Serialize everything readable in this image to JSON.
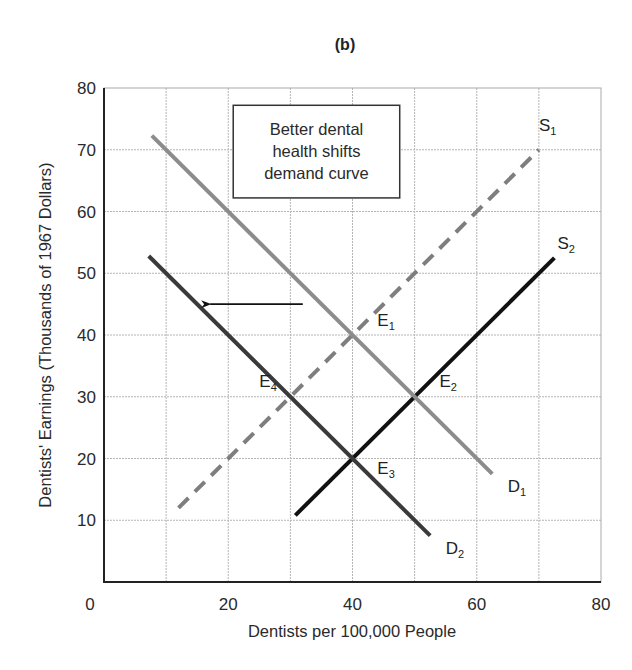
{
  "chart_data": {
    "type": "line",
    "title": "(b)",
    "xlabel": "Dentists per 100,000 People",
    "ylabel": "Dentists' Earnings (Thousands of 1967 Dollars)",
    "xlim": [
      0,
      80
    ],
    "ylim": [
      0,
      80
    ],
    "x_ticks": [
      0,
      20,
      40,
      60,
      80
    ],
    "y_ticks": [
      10,
      20,
      30,
      40,
      50,
      60,
      70,
      80
    ],
    "grid": true,
    "grid_step": 10,
    "legend": "none (curves labeled directly)",
    "series": [
      {
        "name": "S1",
        "label": "S",
        "sub": "1",
        "style": "dashed",
        "color": "#7e7e7e",
        "points": [
          [
            12,
            12
          ],
          [
            70,
            70
          ]
        ],
        "label_pos": [
          70,
          73
        ]
      },
      {
        "name": "S2",
        "label": "S",
        "sub": "2",
        "style": "solid",
        "color": "#111111",
        "points": [
          [
            30.8,
            10.8
          ],
          [
            72.5,
            52.5
          ]
        ],
        "label_pos": [
          73,
          54
        ]
      },
      {
        "name": "D1",
        "label": "D",
        "sub": "1",
        "style": "solid",
        "color": "#8c8c8c",
        "points": [
          [
            7.7,
            72.3
          ],
          [
            62.5,
            17.5
          ]
        ],
        "label_pos": [
          65,
          14.5
        ]
      },
      {
        "name": "D2",
        "label": "D",
        "sub": "2",
        "style": "solid",
        "color": "#3a3a3a",
        "points": [
          [
            7.2,
            52.8
          ],
          [
            52.5,
            7.5
          ]
        ],
        "label_pos": [
          55,
          4.5
        ]
      }
    ],
    "equilibria": [
      {
        "name": "E1",
        "label": "E",
        "sub": "1",
        "x": 40,
        "y": 40,
        "label_pos": [
          44,
          41.5
        ]
      },
      {
        "name": "E2",
        "label": "E",
        "sub": "2",
        "x": 50,
        "y": 30,
        "label_pos": [
          54,
          31.5
        ]
      },
      {
        "name": "E3",
        "label": "E",
        "sub": "3",
        "x": 40,
        "y": 20,
        "label_pos": [
          44,
          17.5
        ]
      },
      {
        "name": "E4",
        "label": "E",
        "sub": "4",
        "x": 30,
        "y": 30,
        "label_pos": [
          25,
          31.5
        ]
      }
    ],
    "annotations": [
      {
        "type": "textbox",
        "lines": [
          "Better dental",
          "health shifts",
          "demand curve"
        ],
        "box": [
          20.8,
          77.2,
          47.6,
          62.2
        ]
      },
      {
        "type": "arrow",
        "from": [
          32,
          45
        ],
        "to": [
          15.8,
          45
        ],
        "meaning": "demand shifts left"
      }
    ]
  }
}
